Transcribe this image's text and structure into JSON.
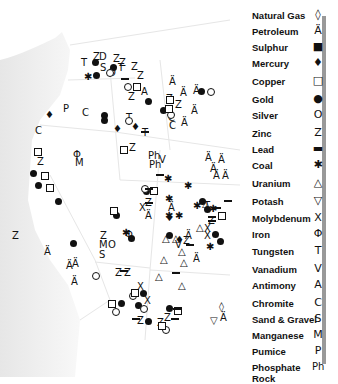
{
  "legend": {
    "items": [
      {
        "label": "Natural Gas",
        "icon": "natural-gas-icon",
        "glyph": "◊"
      },
      {
        "label": "Petroleum",
        "icon": "petroleum-derrick-icon",
        "glyph": "Ä"
      },
      {
        "label": "Sulphur",
        "icon": "filled-square-icon",
        "glyph": "■"
      },
      {
        "label": "Mercury",
        "icon": "mercury-drop-icon",
        "glyph": "♦"
      },
      {
        "label": "Copper",
        "icon": "open-square-icon",
        "glyph": "□"
      },
      {
        "label": "Gold",
        "icon": "filled-circle-icon",
        "glyph": "●"
      },
      {
        "label": "Silver",
        "icon": "open-circle-icon",
        "glyph": "O"
      },
      {
        "label": "Zinc",
        "icon": "letter-z-icon",
        "glyph": "Z"
      },
      {
        "label": "Lead",
        "icon": "bar-icon",
        "glyph": "▬"
      },
      {
        "label": "Coal",
        "icon": "coal-lump-icon",
        "glyph": "✱"
      },
      {
        "label": "Uranium",
        "icon": "triangle-icon",
        "glyph": "△"
      },
      {
        "label": "Potash",
        "icon": "inverted-trapezoid-icon",
        "glyph": "▽"
      },
      {
        "label": "Molybdenum",
        "icon": "x-icon",
        "glyph": "X"
      },
      {
        "label": "Iron",
        "icon": "phi-icon",
        "glyph": "Φ"
      },
      {
        "label": "Tungsten",
        "icon": "letter-t-icon",
        "glyph": "T"
      },
      {
        "label": "Vanadium",
        "icon": "letter-v-icon",
        "glyph": "V"
      },
      {
        "label": "Antimony",
        "icon": "letter-a-icon",
        "glyph": "A"
      },
      {
        "label": "Chromite",
        "icon": "letter-c-icon",
        "glyph": "C"
      },
      {
        "label": "Sand & Gravel",
        "icon": "letter-s-icon",
        "glyph": "S"
      },
      {
        "label": "Manganese",
        "icon": "letter-m-icon",
        "glyph": "M"
      },
      {
        "label": "Pumice",
        "icon": "letter-p-icon",
        "glyph": "P"
      },
      {
        "label": "Phosphate Rock",
        "icon": "letters-ph-icon",
        "glyph": "Ph"
      }
    ]
  },
  "map": {
    "letters": [
      {
        "t": "T",
        "x": 81,
        "y": 58
      },
      {
        "t": "Z",
        "x": 93,
        "y": 52
      },
      {
        "t": "D",
        "x": 99,
        "y": 52
      },
      {
        "t": "S",
        "x": 100,
        "y": 63
      },
      {
        "t": "Z",
        "x": 113,
        "y": 54
      },
      {
        "t": "T",
        "x": 118,
        "y": 63
      },
      {
        "t": "O",
        "x": 108,
        "y": 68
      },
      {
        "t": "P",
        "x": 63,
        "y": 104
      },
      {
        "t": "C",
        "x": 82,
        "y": 108
      },
      {
        "t": "C",
        "x": 35,
        "y": 126
      },
      {
        "t": "Z",
        "x": 131,
        "y": 62
      },
      {
        "t": "Z",
        "x": 119,
        "y": 58
      },
      {
        "t": "Z",
        "x": 137,
        "y": 71
      },
      {
        "t": "Z",
        "x": 128,
        "y": 92
      },
      {
        "t": "A",
        "x": 141,
        "y": 87
      },
      {
        "t": "Z",
        "x": 166,
        "y": 94
      },
      {
        "t": "Z",
        "x": 175,
        "y": 100
      },
      {
        "t": "C",
        "x": 168,
        "y": 113
      },
      {
        "t": "C",
        "x": 169,
        "y": 121
      },
      {
        "t": "T",
        "x": 126,
        "y": 113
      },
      {
        "t": "T",
        "x": 142,
        "y": 128
      },
      {
        "t": "Z",
        "x": 129,
        "y": 143
      },
      {
        "t": "Ph",
        "x": 148,
        "y": 151
      },
      {
        "t": "V",
        "x": 159,
        "y": 155
      },
      {
        "t": "Ph",
        "x": 149,
        "y": 160
      },
      {
        "t": "Z",
        "x": 37,
        "y": 157
      },
      {
        "t": "Φ",
        "x": 73,
        "y": 150
      },
      {
        "t": "M",
        "x": 75,
        "y": 158
      },
      {
        "t": "Z",
        "x": 145,
        "y": 198
      },
      {
        "t": "X",
        "x": 139,
        "y": 203
      },
      {
        "t": "Z",
        "x": 12,
        "y": 231
      },
      {
        "t": "M",
        "x": 99,
        "y": 240
      },
      {
        "t": "O",
        "x": 108,
        "y": 240
      },
      {
        "t": "S",
        "x": 99,
        "y": 250
      },
      {
        "t": "Φ",
        "x": 125,
        "y": 230
      },
      {
        "t": "Z",
        "x": 100,
        "y": 231
      },
      {
        "t": "V",
        "x": 175,
        "y": 240
      },
      {
        "t": "Z",
        "x": 183,
        "y": 236
      },
      {
        "t": "T",
        "x": 204,
        "y": 201
      },
      {
        "t": "Z",
        "x": 208,
        "y": 216
      },
      {
        "t": "X",
        "x": 204,
        "y": 224
      },
      {
        "t": "X",
        "x": 204,
        "y": 231
      },
      {
        "t": "Z",
        "x": 124,
        "y": 268
      },
      {
        "t": "Z",
        "x": 115,
        "y": 268
      },
      {
        "t": "X",
        "x": 137,
        "y": 282
      },
      {
        "t": "X",
        "x": 144,
        "y": 296
      },
      {
        "t": "Z",
        "x": 137,
        "y": 316
      },
      {
        "t": "Z",
        "x": 164,
        "y": 313
      },
      {
        "t": "Z",
        "x": 157,
        "y": 318
      }
    ],
    "petroleum": [
      {
        "x": 169,
        "y": 77
      },
      {
        "x": 180,
        "y": 88
      },
      {
        "x": 193,
        "y": 86
      },
      {
        "x": 191,
        "y": 106
      },
      {
        "x": 181,
        "y": 118
      },
      {
        "x": 205,
        "y": 153
      },
      {
        "x": 218,
        "y": 155
      },
      {
        "x": 210,
        "y": 164
      },
      {
        "x": 213,
        "y": 171
      },
      {
        "x": 222,
        "y": 171
      },
      {
        "x": 168,
        "y": 203
      },
      {
        "x": 145,
        "y": 211
      },
      {
        "x": 185,
        "y": 231
      },
      {
        "x": 193,
        "y": 254
      },
      {
        "x": 44,
        "y": 247
      },
      {
        "x": 66,
        "y": 261
      },
      {
        "x": 72,
        "y": 259
      },
      {
        "x": 71,
        "y": 277
      },
      {
        "x": 220,
        "y": 313
      }
    ],
    "gold": [
      {
        "x": 92,
        "y": 59
      },
      {
        "x": 110,
        "y": 64
      },
      {
        "x": 93,
        "y": 72
      },
      {
        "x": 101,
        "y": 112
      },
      {
        "x": 101,
        "y": 117
      },
      {
        "x": 145,
        "y": 98
      },
      {
        "x": 160,
        "y": 107
      },
      {
        "x": 198,
        "y": 88
      },
      {
        "x": 30,
        "y": 170
      },
      {
        "x": 35,
        "y": 182
      },
      {
        "x": 55,
        "y": 198
      },
      {
        "x": 113,
        "y": 212
      },
      {
        "x": 143,
        "y": 188
      },
      {
        "x": 199,
        "y": 198
      },
      {
        "x": 166,
        "y": 232
      },
      {
        "x": 128,
        "y": 235
      },
      {
        "x": 204,
        "y": 206
      },
      {
        "x": 70,
        "y": 240
      },
      {
        "x": 212,
        "y": 231
      },
      {
        "x": 217,
        "y": 238
      },
      {
        "x": 140,
        "y": 290
      },
      {
        "x": 118,
        "y": 300
      },
      {
        "x": 135,
        "y": 302
      },
      {
        "x": 145,
        "y": 318
      },
      {
        "x": 166,
        "y": 305
      }
    ],
    "coal": [
      {
        "x": 85,
        "y": 74
      },
      {
        "x": 165,
        "y": 176
      },
      {
        "x": 185,
        "y": 183
      },
      {
        "x": 123,
        "y": 230
      },
      {
        "x": 166,
        "y": 196
      },
      {
        "x": 194,
        "y": 203
      },
      {
        "x": 176,
        "y": 213
      },
      {
        "x": 166,
        "y": 213
      },
      {
        "x": 210,
        "y": 206
      },
      {
        "x": 207,
        "y": 244
      }
    ],
    "silver": [
      {
        "x": 106,
        "y": 69
      },
      {
        "x": 124,
        "y": 83
      },
      {
        "x": 167,
        "y": 111
      },
      {
        "x": 207,
        "y": 88
      },
      {
        "x": 125,
        "y": 117
      },
      {
        "x": 141,
        "y": 185
      },
      {
        "x": 92,
        "y": 272
      },
      {
        "x": 129,
        "y": 292
      },
      {
        "x": 112,
        "y": 308
      },
      {
        "x": 140,
        "y": 305
      },
      {
        "x": 162,
        "y": 326
      }
    ],
    "copper": [
      {
        "x": 133,
        "y": 83
      },
      {
        "x": 166,
        "y": 96
      },
      {
        "x": 165,
        "y": 105
      },
      {
        "x": 120,
        "y": 146
      },
      {
        "x": 34,
        "y": 148
      },
      {
        "x": 41,
        "y": 172
      },
      {
        "x": 46,
        "y": 184
      },
      {
        "x": 110,
        "y": 207
      },
      {
        "x": 150,
        "y": 187
      },
      {
        "x": 218,
        "y": 212
      },
      {
        "x": 131,
        "y": 289
      },
      {
        "x": 108,
        "y": 300
      },
      {
        "x": 158,
        "y": 322
      },
      {
        "x": 174,
        "y": 307
      }
    ],
    "lead": [
      {
        "x": 121,
        "y": 78
      },
      {
        "x": 141,
        "y": 131
      },
      {
        "x": 156,
        "y": 174
      },
      {
        "x": 145,
        "y": 188
      },
      {
        "x": 213,
        "y": 207
      },
      {
        "x": 145,
        "y": 202
      },
      {
        "x": 208,
        "y": 216
      },
      {
        "x": 208,
        "y": 220
      },
      {
        "x": 224,
        "y": 200
      },
      {
        "x": 186,
        "y": 244
      },
      {
        "x": 120,
        "y": 270
      },
      {
        "x": 172,
        "y": 272
      },
      {
        "x": 132,
        "y": 318
      },
      {
        "x": 171,
        "y": 318
      },
      {
        "x": 173,
        "y": 308
      }
    ],
    "mercury": [
      {
        "x": 45,
        "y": 110
      },
      {
        "x": 113,
        "y": 124
      },
      {
        "x": 131,
        "y": 122
      },
      {
        "x": 165,
        "y": 213
      },
      {
        "x": 175,
        "y": 235
      }
    ],
    "uranium": [
      {
        "x": 162,
        "y": 234
      },
      {
        "x": 172,
        "y": 234
      },
      {
        "x": 178,
        "y": 247
      },
      {
        "x": 160,
        "y": 255
      },
      {
        "x": 180,
        "y": 258
      },
      {
        "x": 196,
        "y": 223
      },
      {
        "x": 202,
        "y": 199
      },
      {
        "x": 155,
        "y": 272
      },
      {
        "x": 178,
        "y": 281
      }
    ],
    "gas": [
      {
        "x": 219,
        "y": 302
      }
    ],
    "potash": [
      {
        "x": 210,
        "y": 316
      }
    ]
  }
}
